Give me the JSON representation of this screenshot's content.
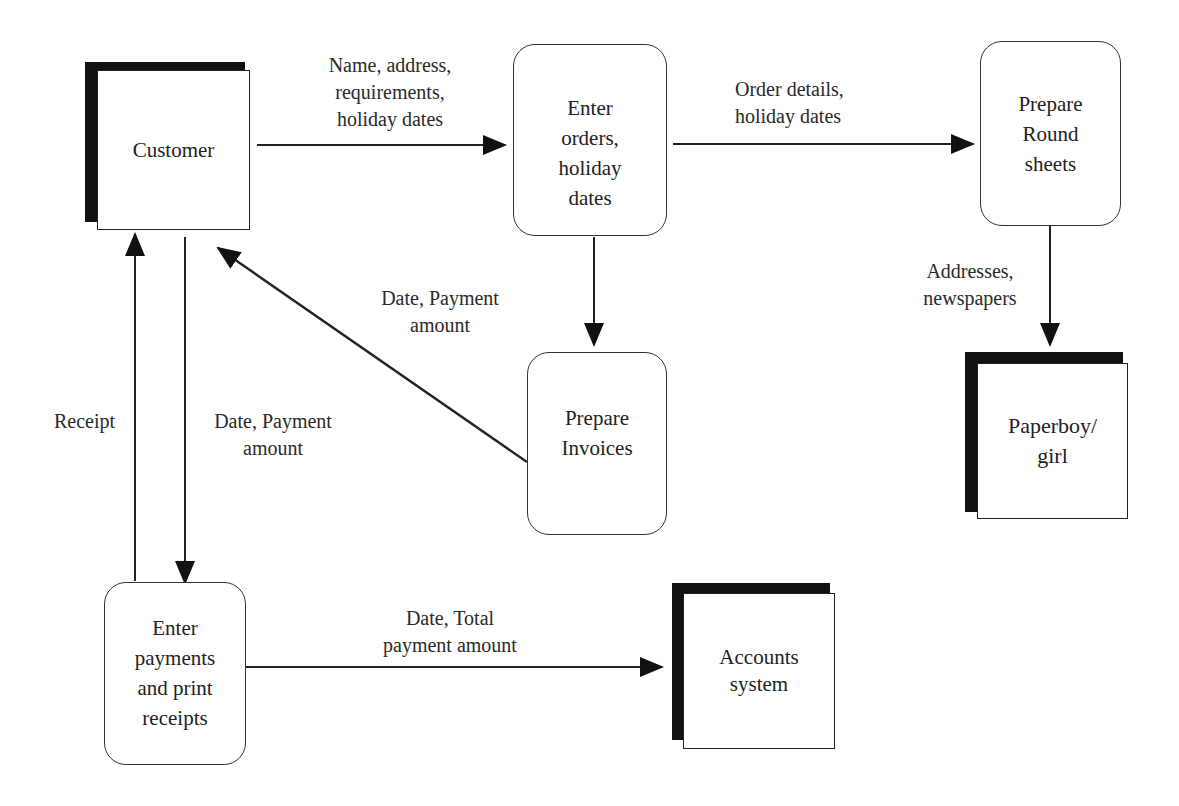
{
  "diagram": {
    "type": "data-flow-diagram",
    "external_entities": [
      {
        "id": "customer",
        "label": "Customer"
      },
      {
        "id": "paperboy",
        "label": "Paperboy/\ngirl"
      },
      {
        "id": "accounts",
        "label": "Accounts\nsystem"
      }
    ],
    "processes": [
      {
        "id": "enter_orders",
        "label": "Enter\norders,\nholiday\ndates"
      },
      {
        "id": "prepare_round",
        "label": "Prepare\nRound\nsheets"
      },
      {
        "id": "prepare_invoices",
        "label": "Prepare\nInvoices"
      },
      {
        "id": "enter_payments",
        "label": "Enter\npayments\nand print\nreceipts"
      }
    ],
    "flows": [
      {
        "from": "customer",
        "to": "enter_orders",
        "label": "Name, address,\nrequirements,\nholiday dates"
      },
      {
        "from": "enter_orders",
        "to": "prepare_round",
        "label": "Order details,\nholiday dates"
      },
      {
        "from": "prepare_round",
        "to": "paperboy",
        "label": "Addresses,\nnewspapers"
      },
      {
        "from": "enter_orders",
        "to": "prepare_invoices",
        "label": ""
      },
      {
        "from": "prepare_invoices",
        "to": "customer",
        "label": "Date, Payment\namount"
      },
      {
        "from": "customer",
        "to": "enter_payments",
        "label": "Date, Payment\namount"
      },
      {
        "from": "enter_payments",
        "to": "customer",
        "label": "Receipt"
      },
      {
        "from": "enter_payments",
        "to": "accounts",
        "label": "Date, Total\npayment amount"
      }
    ]
  }
}
